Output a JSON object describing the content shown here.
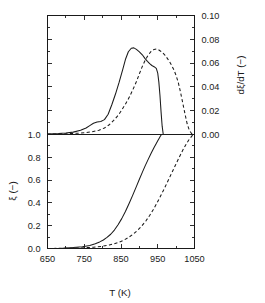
{
  "chart_data": {
    "type": "line",
    "title": "",
    "subtitle": "",
    "xlabel": "T  (K)",
    "xlim": [
      650,
      1050
    ],
    "xticks": [
      650,
      750,
      850,
      950,
      1050
    ],
    "xticklabels": [
      "650",
      "750",
      "850",
      "950",
      "1050"
    ],
    "grid": false,
    "legend": "none",
    "panels": [
      {
        "name": "upper-panel",
        "position": "top",
        "ylabel": "dξ/dT  (−)",
        "ylabel_side": "right",
        "ylim": [
          0.0,
          0.1
        ],
        "yticks": [
          0.0,
          0.02,
          0.04,
          0.06,
          0.08,
          0.1
        ],
        "yticklabels": [
          "0.00",
          "0.02",
          "0.04",
          "0.06",
          "0.08",
          "0.10"
        ],
        "series": [
          {
            "name": "solid-derivative",
            "style": "solid",
            "x": [
              650,
              680,
              700,
              720,
              740,
              755,
              765,
              775,
              785,
              795,
              805,
              815,
              825,
              835,
              845,
              855,
              862,
              870,
              878,
              885,
              892,
              900,
              908,
              915,
              922,
              928,
              934,
              940,
              946,
              950,
              953,
              956,
              959,
              962,
              965
            ],
            "y": [
              0.0005,
              0.0008,
              0.0012,
              0.002,
              0.0035,
              0.0055,
              0.0075,
              0.0095,
              0.0105,
              0.011,
              0.0125,
              0.017,
              0.025,
              0.034,
              0.044,
              0.055,
              0.063,
              0.0695,
              0.0725,
              0.0728,
              0.0715,
              0.0695,
              0.067,
              0.064,
              0.0615,
              0.0595,
              0.058,
              0.057,
              0.0555,
              0.0515,
              0.044,
              0.033,
              0.019,
              0.007,
              0.0
            ]
          },
          {
            "name": "dashed-derivative",
            "style": "dashed",
            "x": [
              650,
              700,
              740,
              770,
              790,
              805,
              818,
              830,
              842,
              852,
              862,
              872,
              882,
              892,
              900,
              908,
              916,
              924,
              932,
              940,
              946,
              952,
              958,
              964,
              970,
              976,
              982,
              988,
              994,
              1000,
              1006,
              1012,
              1018,
              1024,
              1030,
              1036,
              1042,
              1046
            ],
            "y": [
              0.0003,
              0.0006,
              0.0012,
              0.0022,
              0.0035,
              0.0055,
              0.0082,
              0.0118,
              0.016,
              0.0205,
              0.0255,
              0.031,
              0.0375,
              0.0445,
              0.051,
              0.0572,
              0.0625,
              0.0668,
              0.0698,
              0.0715,
              0.0718,
              0.0712,
              0.07,
              0.0685,
              0.0665,
              0.064,
              0.0612,
              0.058,
              0.0542,
              0.0495,
              0.0435,
              0.0355,
              0.0265,
              0.0175,
              0.009,
              0.0035,
              0.0008,
              0.0
            ]
          }
        ]
      },
      {
        "name": "lower-panel",
        "position": "bottom",
        "ylabel": "ξ  (−)",
        "ylabel_side": "left",
        "ylim": [
          0.0,
          1.0
        ],
        "yticks": [
          0.0,
          0.2,
          0.4,
          0.6,
          0.8,
          1.0
        ],
        "yticklabels": [
          "0.0",
          "0.2",
          "0.4",
          "0.6",
          "0.8",
          "1.0"
        ],
        "series": [
          {
            "name": "solid-conversion",
            "style": "solid",
            "x": [
              650,
              690,
              720,
              745,
              765,
              780,
              792,
              802,
              812,
              822,
              832,
              842,
              852,
              862,
              872,
              882,
              892,
              900,
              908,
              916,
              924,
              932,
              940,
              946,
              950,
              954,
              957,
              960
            ],
            "y": [
              0.0,
              0.003,
              0.008,
              0.016,
              0.027,
              0.042,
              0.058,
              0.075,
              0.097,
              0.125,
              0.162,
              0.208,
              0.262,
              0.325,
              0.395,
              0.468,
              0.545,
              0.608,
              0.668,
              0.727,
              0.782,
              0.836,
              0.886,
              0.921,
              0.945,
              0.968,
              0.985,
              1.0
            ]
          },
          {
            "name": "dashed-conversion",
            "style": "dashed",
            "x": [
              650,
              700,
              740,
              775,
              800,
              818,
              832,
              845,
              858,
              870,
              882,
              894,
              906,
              918,
              928,
              938,
              948,
              958,
              968,
              978,
              988,
              998,
              1008,
              1018,
              1026,
              1034,
              1040,
              1046
            ],
            "y": [
              0.0,
              0.002,
              0.005,
              0.011,
              0.02,
              0.03,
              0.042,
              0.056,
              0.074,
              0.096,
              0.123,
              0.156,
              0.196,
              0.243,
              0.29,
              0.342,
              0.4,
              0.462,
              0.527,
              0.594,
              0.662,
              0.73,
              0.797,
              0.862,
              0.908,
              0.95,
              0.975,
              1.0
            ]
          }
        ]
      }
    ]
  }
}
